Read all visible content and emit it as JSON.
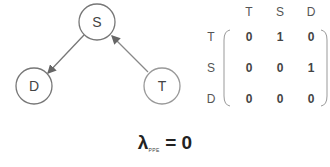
{
  "graph": {
    "nodes": [
      {
        "id": "S",
        "label": "S",
        "cx": 97,
        "cy": 22,
        "r": 18
      },
      {
        "id": "D",
        "label": "D",
        "cx": 34,
        "cy": 86,
        "r": 18
      },
      {
        "id": "T",
        "label": "T",
        "cx": 162,
        "cy": 86,
        "r": 18
      }
    ],
    "edges": [
      {
        "from": "S",
        "to": "D"
      },
      {
        "from": "T",
        "to": "S"
      }
    ],
    "stroke_color": "#777777"
  },
  "matrix": {
    "column_headers": [
      "T",
      "S",
      "D"
    ],
    "row_headers": [
      "T",
      "S",
      "D"
    ],
    "rows": [
      [
        "0",
        "1",
        "0"
      ],
      [
        "0",
        "0",
        "1"
      ],
      [
        "0",
        "0",
        "0"
      ]
    ]
  },
  "formula": {
    "symbol": "λ",
    "subscript": "PPE",
    "equals": "= 0"
  }
}
